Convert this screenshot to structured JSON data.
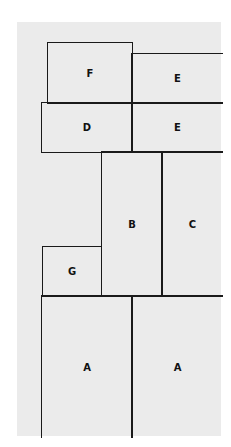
{
  "diagram": {
    "title": "",
    "background_color": "#ebebeb",
    "line_color": "#1a1a1a",
    "blocks": [
      {
        "id": "F",
        "label": "F"
      },
      {
        "id": "E1",
        "label": "E"
      },
      {
        "id": "D",
        "label": "D"
      },
      {
        "id": "E2",
        "label": "E"
      },
      {
        "id": "B",
        "label": "B"
      },
      {
        "id": "C",
        "label": "C"
      },
      {
        "id": "G",
        "label": "G"
      },
      {
        "id": "A1",
        "label": "A"
      },
      {
        "id": "A2",
        "label": "A"
      }
    ]
  }
}
